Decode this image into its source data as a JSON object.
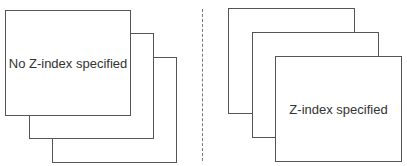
{
  "left_group": {
    "caption": "No Z-index specified",
    "box_count": 3
  },
  "right_group": {
    "caption": "Z-index specified",
    "box_count": 3
  },
  "colors": {
    "border": "#555555",
    "text": "#333333",
    "divider": "#777777",
    "background": "#ffffff"
  }
}
